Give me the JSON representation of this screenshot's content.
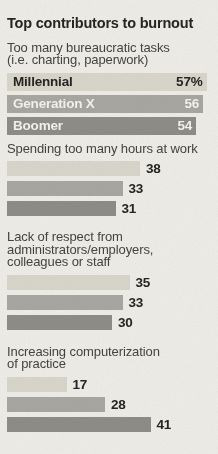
{
  "title": "Top contributors to burnout",
  "colors": {
    "background": "#efede7",
    "bar_millennial": "#d9d6cb",
    "bar_generation_x": "#a8a7a1",
    "bar_boomer": "#8e8d87",
    "text_dark": "#262521",
    "text_label": "#45443e",
    "text_on_dark_bar": "#f4f3ee"
  },
  "chart_data": {
    "type": "bar",
    "orientation": "horizontal",
    "title": "Top contributors to burnout",
    "unit": "percent",
    "series_labels": [
      "Millennial",
      "Generation X",
      "Boomer"
    ],
    "axis_max": 60,
    "legend_position": "inside-first-group-bars",
    "grid": false,
    "groups": [
      {
        "label": "Too many bureaucratic tasks\n(i.e. charting, paperwork)",
        "values": [
          57,
          56,
          54
        ],
        "value_labels": [
          "57%",
          "56",
          "54"
        ],
        "category_labels_inside": true,
        "value_label_position": "inside-right"
      },
      {
        "label": "Spending too many hours at work",
        "values": [
          38,
          33,
          31
        ],
        "value_labels": [
          "38",
          "33",
          "31"
        ],
        "category_labels_inside": false,
        "value_label_position": "outside-right"
      },
      {
        "label": "Lack of respect from\nadministrators/employers,\ncolleagues or staff",
        "values": [
          35,
          33,
          30
        ],
        "value_labels": [
          "35",
          "33",
          "30"
        ],
        "category_labels_inside": false,
        "value_label_position": "outside-right"
      },
      {
        "label": "Increasing computerization\nof practice",
        "values": [
          17,
          28,
          41
        ],
        "value_labels": [
          "17",
          "28",
          "41"
        ],
        "category_labels_inside": false,
        "value_label_position": "outside-right"
      }
    ]
  }
}
